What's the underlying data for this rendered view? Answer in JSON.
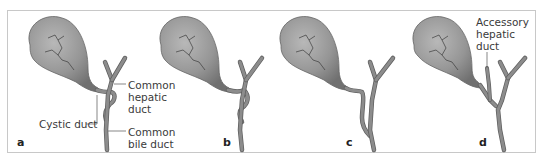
{
  "figure": {
    "panels": [
      {
        "letter": "a",
        "labels": {
          "cystic": "Cystic duct",
          "chd1": "Common",
          "chd2": "hepatic",
          "chd3": "duct",
          "cbd1": "Common",
          "cbd2": "bile duct"
        }
      },
      {
        "letter": "b"
      },
      {
        "letter": "c"
      },
      {
        "letter": "d",
        "labels": {
          "acc1": "Accessory",
          "acc2": "hepatic",
          "acc3": "duct"
        }
      }
    ],
    "colors": {
      "gallbladder_fill": "#9a9a9a",
      "duct_fill": "#8c8c8c",
      "duct_outline": "#5e5e5e",
      "vessel_lines": "#3c3c3c",
      "frame": "#c8c8c8",
      "leader_lines": "#555555"
    }
  }
}
